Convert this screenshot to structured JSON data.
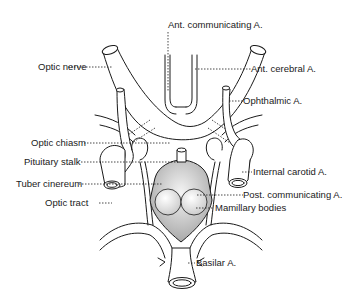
{
  "figure": {
    "colors": {
      "ink": "#1a1a1a",
      "background": "#ffffff",
      "shade_dark": "#b9b9b9",
      "shade_light": "#e6e6e6"
    },
    "labels": {
      "ant_communicating": "Ant. communicating A.",
      "ant_cerebral": "Ant. cerebral A.",
      "ophthalmic": "Ophthalmic A.",
      "internal_carotid": "Internal carotid A.",
      "post_communicating": "Post. communicating A.",
      "mamillary_bodies": "Mamillary bodies",
      "basilar": "Basilar A.",
      "optic_nerve": "Optic nerve",
      "optic_chiasm": "Optic chiasm",
      "pituitary_stalk": "Pituitary stalk",
      "tuber_cinereum": "Tuber cinereum",
      "optic_tract": "Optic tract"
    }
  }
}
